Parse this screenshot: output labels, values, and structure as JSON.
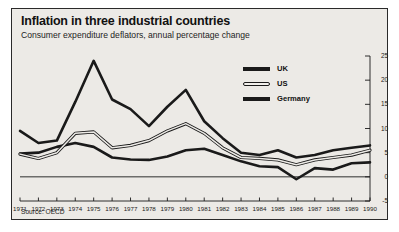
{
  "figure": {
    "title": "Inflation in three industrial countries",
    "subtitle": "Consumer expenditure deflators, annual percentage change",
    "source": "Source: OECD",
    "background_color": "#eceae6",
    "border_color": "#2a2a2a",
    "line_color": "#1a1a1a"
  },
  "legend": {
    "position": "upper-right-inside",
    "items": [
      {
        "label": "UK",
        "style": "solid"
      },
      {
        "label": "US",
        "style": "hollow"
      },
      {
        "label": "Germany",
        "style": "solid"
      }
    ]
  },
  "chart_data": {
    "type": "line",
    "title": "Inflation in three industrial countries",
    "subtitle": "Consumer expenditure deflators, annual percentage change",
    "xlabel": "",
    "ylabel": "",
    "ylim": [
      -5,
      25
    ],
    "yticks": [
      -5,
      0,
      5,
      10,
      15,
      20,
      25
    ],
    "ytick_labels": [
      "-5",
      "0",
      "5",
      "10",
      "15",
      "20",
      "25"
    ],
    "y_axis_position": "right",
    "grid": false,
    "zero_line": true,
    "x": [
      1971,
      1972,
      1973,
      1974,
      1975,
      1976,
      1977,
      1978,
      1979,
      1980,
      1981,
      1982,
      1983,
      1984,
      1985,
      1986,
      1987,
      1988,
      1989,
      1990
    ],
    "categories": [
      "1971",
      "1972",
      "1973",
      "1974",
      "1975",
      "1976",
      "1977",
      "1978",
      "1979",
      "1980",
      "1981",
      "1982",
      "1983",
      "1984",
      "1985",
      "1986",
      "1987",
      "1988",
      "1989",
      "1990"
    ],
    "series": [
      {
        "name": "UK",
        "style": "solid",
        "values": [
          9.5,
          7.0,
          7.5,
          15.5,
          24.0,
          16.0,
          14.0,
          10.5,
          14.5,
          18.0,
          11.5,
          8.0,
          5.0,
          4.5,
          5.5,
          4.0,
          4.5,
          5.5,
          6.0,
          6.5
        ]
      },
      {
        "name": "US",
        "style": "hollow",
        "values": [
          4.7,
          3.8,
          5.0,
          9.0,
          9.3,
          6.0,
          6.5,
          7.5,
          9.5,
          11.0,
          9.0,
          6.0,
          4.0,
          3.8,
          3.5,
          2.5,
          3.5,
          4.0,
          4.5,
          5.5
        ]
      },
      {
        "name": "Germany",
        "style": "solid",
        "values": [
          4.8,
          5.0,
          6.2,
          7.0,
          6.2,
          4.0,
          3.6,
          3.5,
          4.2,
          5.5,
          5.8,
          4.5,
          3.2,
          2.2,
          2.0,
          -0.5,
          1.8,
          1.5,
          2.8,
          3.0
        ]
      }
    ]
  }
}
